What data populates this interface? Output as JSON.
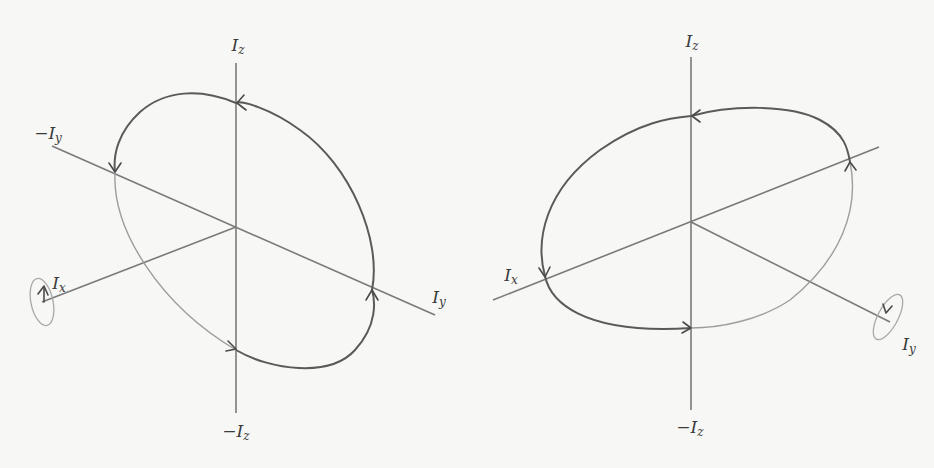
{
  "panels": [
    {
      "id": "left",
      "labels": {
        "z_pos": {
          "main": "I",
          "sub": "z",
          "prefix": ""
        },
        "z_neg": {
          "main": "I",
          "sub": "z",
          "prefix": "−"
        },
        "y_neg": {
          "main": "I",
          "sub": "y",
          "prefix": "−"
        },
        "y_pos": {
          "main": "I",
          "sub": "y",
          "prefix": ""
        },
        "x_pos": {
          "main": "I",
          "sub": "x",
          "prefix": ""
        }
      },
      "rotation_axis": "I_x",
      "orbit_description": "Precession ellipse tilted, rotating about I_x axis"
    },
    {
      "id": "right",
      "labels": {
        "z_pos": {
          "main": "I",
          "sub": "z",
          "prefix": ""
        },
        "z_neg": {
          "main": "I",
          "sub": "z",
          "prefix": "−"
        },
        "x_pos": {
          "main": "I",
          "sub": "x",
          "prefix": ""
        },
        "y_pos": {
          "main": "I",
          "sub": "y",
          "prefix": ""
        }
      },
      "rotation_axis": "I_y",
      "orbit_description": "Precession ellipse tilted, rotating about I_y axis"
    }
  ],
  "colors": {
    "background": "#f7f7f5",
    "axis": "#7a7a7a",
    "curve_front": "#5a5a5a",
    "curve_back": "#9d9d9d",
    "text": "#3a3a3a"
  }
}
